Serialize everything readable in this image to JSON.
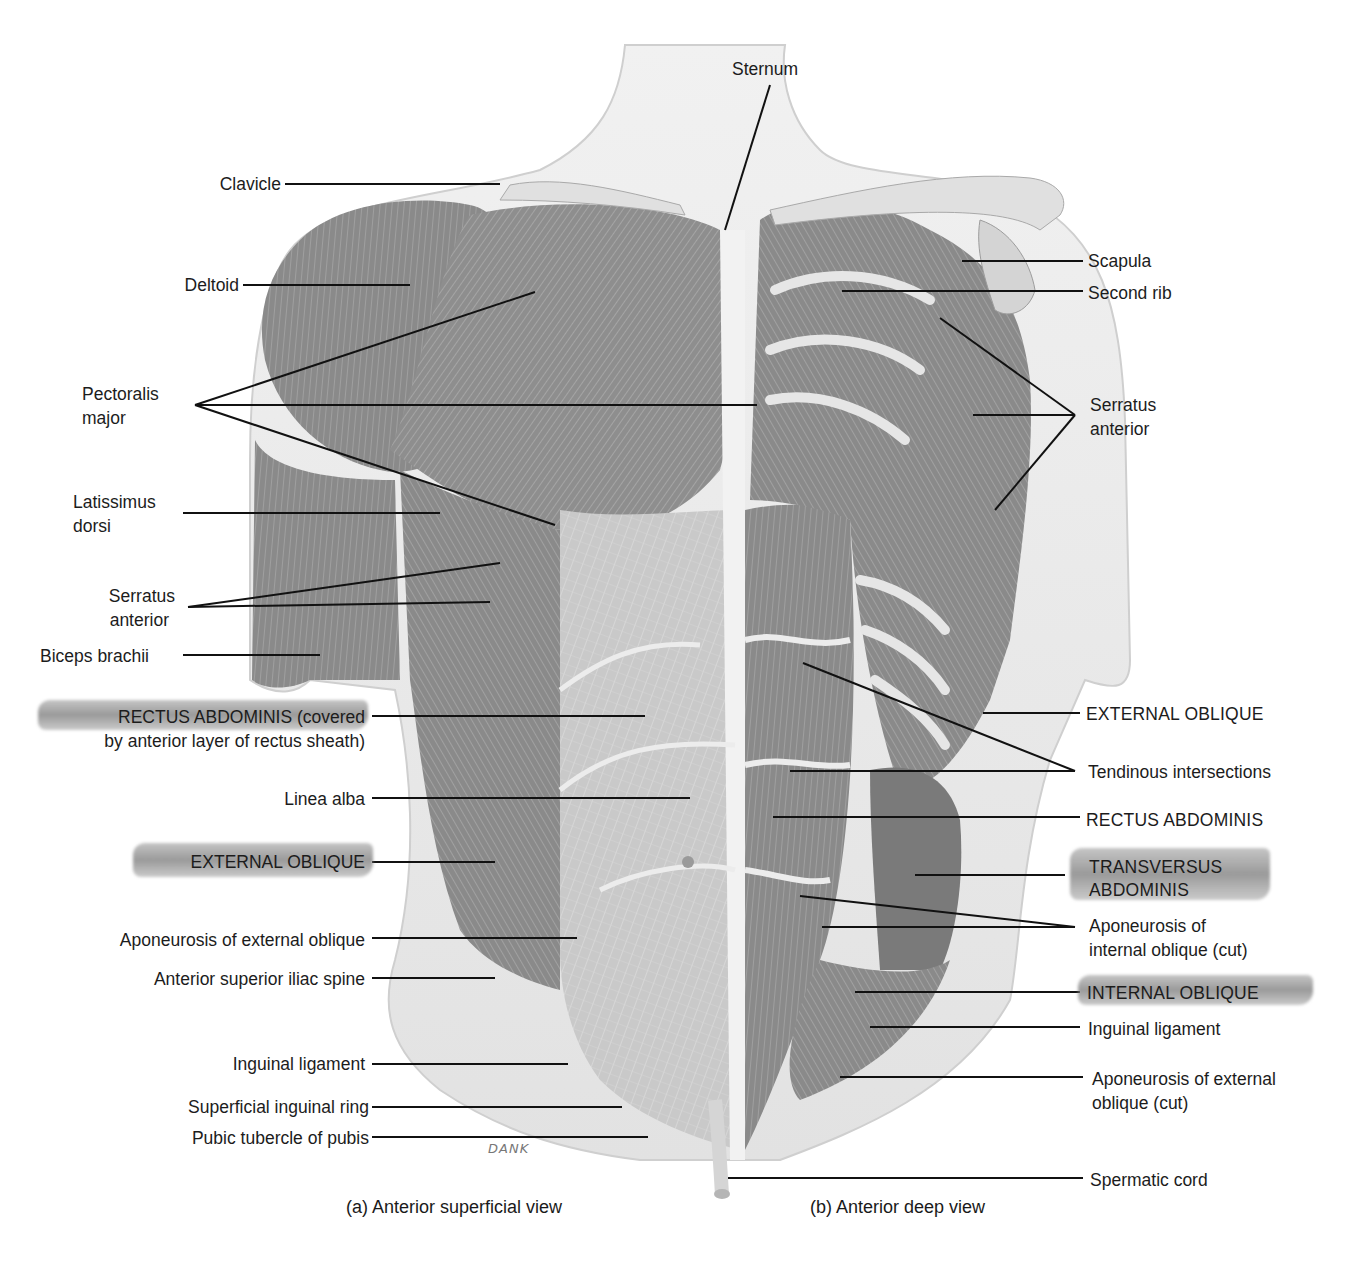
{
  "figure": {
    "captions": {
      "a": "(a) Anterior superficial view",
      "b": "(b) Anterior deep view"
    },
    "signature": "DANK",
    "labels_top": {
      "sternum": "Sternum"
    },
    "labels_left": [
      {
        "id": "clavicle",
        "lines": [
          "Clavicle"
        ]
      },
      {
        "id": "deltoid",
        "lines": [
          "Deltoid"
        ]
      },
      {
        "id": "pectoralis-major",
        "lines": [
          "Pectoralis",
          "major"
        ]
      },
      {
        "id": "latissimus-dorsi",
        "lines": [
          "Latissimus",
          "dorsi"
        ]
      },
      {
        "id": "serratus-anterior-left",
        "lines": [
          "Serratus",
          "anterior"
        ]
      },
      {
        "id": "biceps-brachii",
        "lines": [
          "Biceps brachii"
        ]
      },
      {
        "id": "rectus-abdominis-covered",
        "lines": [
          "RECTUS ABDOMINIS (covered",
          "by anterior layer of rectus sheath)"
        ],
        "highlighted": true
      },
      {
        "id": "linea-alba",
        "lines": [
          "Linea alba"
        ]
      },
      {
        "id": "external-oblique-left",
        "lines": [
          "EXTERNAL OBLIQUE"
        ],
        "highlighted": true
      },
      {
        "id": "aponeurosis-external-oblique",
        "lines": [
          "Aponeurosis of external oblique"
        ]
      },
      {
        "id": "anterior-superior-iliac-spine",
        "lines": [
          "Anterior superior iliac spine"
        ]
      },
      {
        "id": "inguinal-ligament-left",
        "lines": [
          "Inguinal ligament"
        ]
      },
      {
        "id": "superficial-inguinal-ring",
        "lines": [
          "Superficial inguinal ring"
        ]
      },
      {
        "id": "pubic-tubercle",
        "lines": [
          "Pubic tubercle of pubis"
        ]
      }
    ],
    "labels_right": [
      {
        "id": "scapula",
        "lines": [
          "Scapula"
        ]
      },
      {
        "id": "second-rib",
        "lines": [
          "Second rib"
        ]
      },
      {
        "id": "serratus-anterior-right",
        "lines": [
          "Serratus",
          "anterior"
        ]
      },
      {
        "id": "external-oblique-right",
        "lines": [
          "EXTERNAL OBLIQUE"
        ]
      },
      {
        "id": "tendinous-intersections",
        "lines": [
          "Tendinous intersections"
        ]
      },
      {
        "id": "rectus-abdominis",
        "lines": [
          "RECTUS ABDOMINIS"
        ]
      },
      {
        "id": "transversus-abdominis",
        "lines": [
          "TRANSVERSUS",
          "ABDOMINIS"
        ],
        "highlighted": true
      },
      {
        "id": "aponeurosis-internal-oblique",
        "lines": [
          "Aponeurosis of",
          "internal oblique (cut)"
        ]
      },
      {
        "id": "internal-oblique",
        "lines": [
          "INTERNAL OBLIQUE"
        ],
        "highlighted": true
      },
      {
        "id": "inguinal-ligament-right",
        "lines": [
          "Inguinal ligament"
        ]
      },
      {
        "id": "aponeurosis-external-oblique-cut",
        "lines": [
          "Aponeurosis of external",
          "oblique (cut)"
        ]
      },
      {
        "id": "spermatic-cord",
        "lines": [
          "Spermatic cord"
        ]
      }
    ]
  },
  "colors": {
    "background": "#ffffff",
    "skin": "#e6e6e6",
    "muscle": "#8c8c8c",
    "muscle_dark": "#6e6e6e",
    "tendon": "#efefef",
    "bone": "#dcdcdc",
    "leader": "#111111",
    "highlight": "#9a9a9a"
  }
}
